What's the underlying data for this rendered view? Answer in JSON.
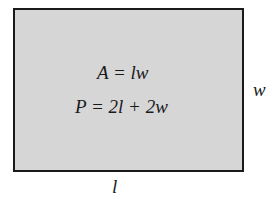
{
  "diagram": {
    "shape": "rectangle",
    "fill_color": "#d6d6d6",
    "border_color": "#1a1a1a",
    "formulas": {
      "area": "A = lw",
      "perimeter": "P = 2l + 2w"
    },
    "labels": {
      "width": "w",
      "length": "l"
    }
  }
}
